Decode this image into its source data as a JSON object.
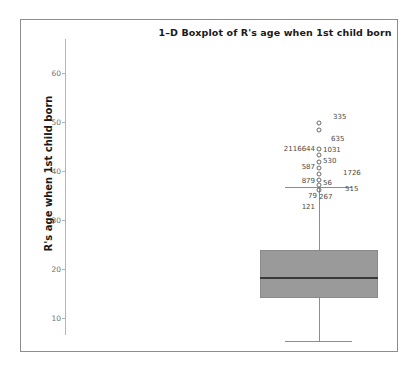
{
  "chart_data": {
    "type": "boxplot",
    "title": "1–D Boxplot of R's age when 1st child born",
    "xlabel": "",
    "ylabel": "R's age when 1st child born",
    "ylim": [
      7,
      63
    ],
    "yticks": [
      10,
      20,
      30,
      40,
      50,
      60
    ],
    "ytick_labels": [
      "10",
      "20",
      "30",
      "40",
      "50",
      "60"
    ],
    "grid": false,
    "legend": null,
    "series": [
      {
        "name": "R's age when 1st child born",
        "min_whisker": 12,
        "q1": 20,
        "median": 23,
        "q3": 28,
        "max_whisker": 40,
        "outliers": [
          {
            "case_label": "335",
            "value": 51.4
          },
          {
            "case_label": "635",
            "value": 50.2
          },
          {
            "case_label": "2116644",
            "value": 47.0
          },
          {
            "case_label": "1031",
            "value": 46.7
          },
          {
            "case_label": "530",
            "value": 45.6
          },
          {
            "case_label": "587",
            "value": 44.3
          },
          {
            "case_label": "1726",
            "value": 43.2
          },
          {
            "case_label": "879",
            "value": 42.0
          },
          {
            "case_label": "56",
            "value": 41.5
          },
          {
            "case_label": "515",
            "value": 41.0
          },
          {
            "case_label": "79",
            "value": 40.3
          },
          {
            "case_label": "267",
            "value": 40.1
          },
          {
            "case_label": "121",
            "value": 39.2
          }
        ]
      }
    ]
  },
  "axis": {
    "ticks": [
      {
        "label": "60",
        "top": 36
      },
      {
        "label": "50",
        "top": 85
      },
      {
        "label": "40",
        "top": 134
      },
      {
        "label": "30",
        "top": 183
      },
      {
        "label": "20",
        "top": 232
      },
      {
        "label": "10",
        "top": 281
      }
    ]
  },
  "box": {
    "left": 195,
    "width": 118,
    "top": 213,
    "height": 48,
    "median_offset": 27,
    "whisker_x": 254,
    "upper_whisker_top": 150,
    "upper_whisker_height": 63,
    "lower_whisker_top": 261,
    "lower_whisker_height": 43,
    "cap_left": 220,
    "cap_width": 67,
    "upper_cap_top": 150,
    "lower_cap_top": 304
  },
  "outlier_markers": [
    {
      "name": "outlier-335-a",
      "x": 254,
      "y": 86
    },
    {
      "name": "outlier-335-b",
      "x": 254,
      "y": 93
    },
    {
      "name": "outlier-2116644",
      "x": 254,
      "y": 112
    },
    {
      "name": "outlier-1031",
      "x": 254,
      "y": 118
    },
    {
      "name": "outlier-530",
      "x": 254,
      "y": 125
    },
    {
      "name": "outlier-587",
      "x": 254,
      "y": 131
    },
    {
      "name": "outlier-1726",
      "x": 254,
      "y": 137
    },
    {
      "name": "outlier-879",
      "x": 254,
      "y": 143
    },
    {
      "name": "outlier-56",
      "x": 254,
      "y": 148
    },
    {
      "name": "outlier-515",
      "x": 254,
      "y": 153
    }
  ],
  "outlier_labels": [
    {
      "name": "outlier-label-335",
      "text": "335",
      "x": 268,
      "y": 80,
      "side": "right"
    },
    {
      "name": "outlier-label-635",
      "text": "635",
      "x": 266,
      "y": 102,
      "side": "right"
    },
    {
      "name": "outlier-label-2116644",
      "text": "2116644",
      "x": 250,
      "y": 112,
      "side": "left"
    },
    {
      "name": "outlier-label-1031",
      "text": "1031",
      "x": 258,
      "y": 113,
      "side": "right"
    },
    {
      "name": "outlier-label-530",
      "text": "530",
      "x": 258,
      "y": 124,
      "side": "right"
    },
    {
      "name": "outlier-label-587",
      "text": "587",
      "x": 250,
      "y": 130,
      "side": "left"
    },
    {
      "name": "outlier-label-1726",
      "text": "1726",
      "x": 278,
      "y": 136,
      "side": "right"
    },
    {
      "name": "outlier-label-879",
      "text": "879",
      "x": 250,
      "y": 144,
      "side": "left"
    },
    {
      "name": "outlier-label-56",
      "text": "56",
      "x": 258,
      "y": 146,
      "side": "right"
    },
    {
      "name": "outlier-label-515",
      "text": "515",
      "x": 280,
      "y": 152,
      "side": "right"
    },
    {
      "name": "outlier-label-79",
      "text": "79",
      "x": 252,
      "y": 159,
      "side": "left"
    },
    {
      "name": "outlier-label-267",
      "text": "267",
      "x": 254,
      "y": 160,
      "side": "right"
    },
    {
      "name": "outlier-label-121",
      "text": "121",
      "x": 250,
      "y": 170,
      "side": "left"
    }
  ],
  "colors": {
    "box_fill": "#9a9a9a",
    "median": "#3a3a3a",
    "whisker": "#8d8d8d",
    "axis": "#b4b4b4",
    "frame": "#8d8d8d",
    "text": "#1a1a1a",
    "tick_text": "#6f6f6f",
    "background": "#ffffff"
  }
}
